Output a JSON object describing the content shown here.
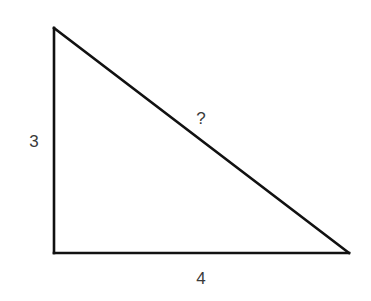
{
  "diagram": {
    "type": "right-triangle",
    "stroke_color": "#111111",
    "label_color": "#3a3a3a",
    "vertices": {
      "top_left": [
        54,
        28
      ],
      "bottom_left": [
        54,
        253
      ],
      "bottom_right": [
        349,
        253
      ]
    },
    "labels": {
      "vertical_leg": "3",
      "horizontal_leg": "4",
      "hypotenuse": "?"
    },
    "label_positions": {
      "vertical_leg": [
        34,
        141
      ],
      "horizontal_leg": [
        201,
        278
      ],
      "hypotenuse": [
        201,
        118
      ]
    }
  }
}
